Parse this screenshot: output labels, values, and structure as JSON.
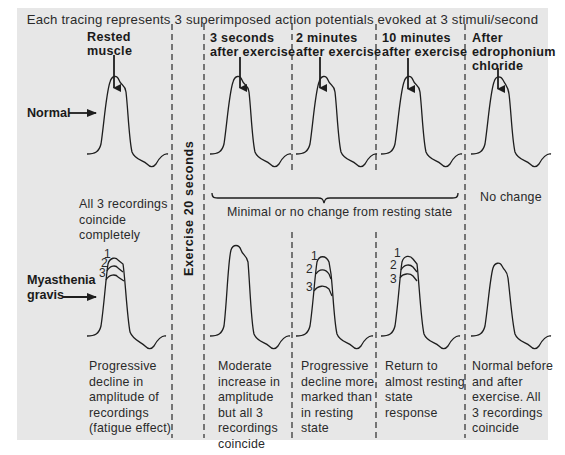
{
  "title": "Each tracing represents 3 superimposed action potentials evoked at 3 stimuli/second",
  "columns": [
    {
      "id": "rested",
      "header_lines": [
        "Rested",
        "muscle"
      ]
    },
    {
      "id": "3s",
      "header_lines": [
        "3 seconds",
        "after exercise"
      ]
    },
    {
      "id": "2m",
      "header_lines": [
        "2 minutes",
        "after exercise"
      ]
    },
    {
      "id": "10m",
      "header_lines": [
        "10 minutes",
        "after exercise"
      ]
    },
    {
      "id": "edro",
      "header_lines": [
        "After",
        "edrophonium",
        "chloride"
      ]
    }
  ],
  "exercise_label": "Exercise 20 seconds",
  "rows": {
    "normal": {
      "label": "Normal",
      "rested_desc": [
        "All 3 recordings",
        "coincide",
        "completely"
      ],
      "brace_desc": "Minimal or no change from resting state",
      "edro_desc": "No change"
    },
    "mg": {
      "label_lines": [
        "Myasthenia",
        "gravis"
      ],
      "trace_labels": [
        "1",
        "2",
        "3"
      ],
      "descs": {
        "rested": [
          "Progressive",
          "decline in",
          "amplitude of",
          "recordings",
          "(fatigue effect)"
        ],
        "3s": [
          "Moderate",
          "increase in",
          "amplitude",
          "but all 3",
          "recordings",
          "coincide"
        ],
        "2m": [
          "Progressive",
          "decline more",
          "marked than",
          "in resting",
          "state"
        ],
        "10m": [
          "Return to",
          "almost resting",
          "state",
          "response"
        ],
        "edro": [
          "Normal before",
          "and after",
          "exercise. All",
          "3 recordings",
          "coincide"
        ]
      }
    }
  },
  "colors": {
    "panel": "#e7e7e7",
    "ink": "#1e1e1e",
    "background": "#ffffff"
  }
}
